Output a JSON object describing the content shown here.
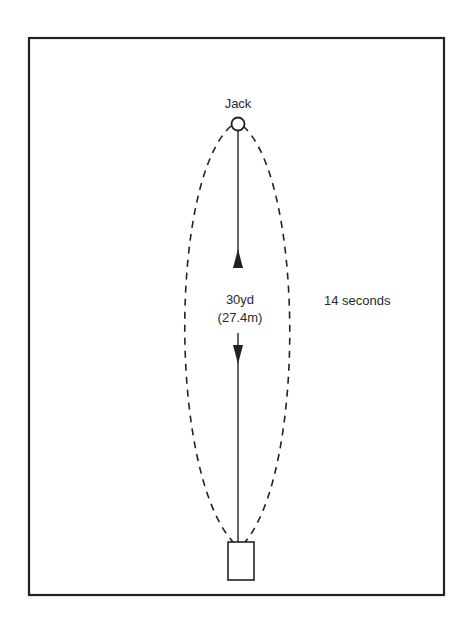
{
  "diagram": {
    "labels": {
      "jack": "Jack",
      "distance_yd": "30yd",
      "distance_m": "(27.4m)",
      "time": "14 seconds"
    },
    "colors": {
      "ink": "#222222",
      "background": "#ffffff"
    }
  }
}
